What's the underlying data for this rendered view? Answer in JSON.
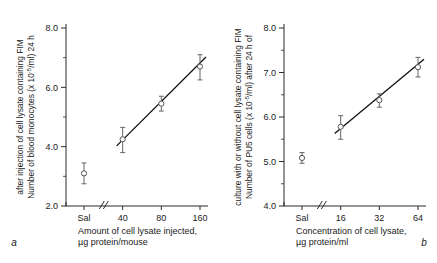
{
  "figure": {
    "background": "#ffffff",
    "line_color": "#111111",
    "marker_color": "#555555",
    "error_color": "#666666"
  },
  "panels": [
    {
      "letter": "a",
      "ylabel_line1": "Number of blood monocytes (x 10",
      "ylabel_exp": "-5",
      "ylabel_line1b": "/ml) 24 h",
      "ylabel_line2": "after injection of cell lysate containing FIM",
      "xlabel_line1": "Amount of cell lysate injected,",
      "xlabel_line2": "µg protein/mouse",
      "chart_data": {
        "type": "scatter",
        "title": "",
        "xlabel": "Amount of cell lysate injected, µg protein/mouse",
        "ylabel": "Number of blood monocytes (x 10-5/ml) 24 h after injection of cell lysate containing FIM",
        "categories": [
          "Sal",
          "40",
          "80",
          "160"
        ],
        "xticklabels": [
          "Sal",
          "40",
          "80",
          "160"
        ],
        "yticklabels": [
          "2.0",
          "4.0",
          "6.0",
          "8.0"
        ],
        "ytickvalues": [
          2.0,
          4.0,
          6.0,
          8.0
        ],
        "yminorticks": [
          3.0,
          5.0,
          7.0
        ],
        "ylim": [
          2.0,
          8.4
        ],
        "axis_break": true,
        "axis_break_after": "Sal",
        "grid": false,
        "legend": "none",
        "points": [
          {
            "x": "Sal",
            "y": 3.1,
            "err_low": 0.35,
            "err_high": 0.35,
            "on_fit": false
          },
          {
            "x": "40",
            "y": 4.25,
            "err_low": 0.45,
            "err_high": 0.4,
            "on_fit": true
          },
          {
            "x": "80",
            "y": 5.45,
            "err_low": 0.25,
            "err_high": 0.25,
            "on_fit": true
          },
          {
            "x": "160",
            "y": 6.7,
            "err_low": 0.45,
            "err_high": 0.4,
            "on_fit": true
          }
        ],
        "fit_line": {
          "x_start": "40",
          "y_start": 4.1,
          "x_end": "160",
          "y_end": 6.95
        }
      }
    },
    {
      "letter": "b",
      "ylabel_line1": "Number of PU5 cells (x 10",
      "ylabel_exp": "-5",
      "ylabel_line1b": "/ml) after 24 h of",
      "ylabel_line2": "culture with or without cell lysate containing FIM",
      "xlabel_line1": "Concentration of cell lysate,",
      "xlabel_line2": "µg protein/ml",
      "chart_data": {
        "type": "scatter",
        "title": "",
        "xlabel": "Concentration of cell lysate, µg protein/ml",
        "ylabel": "Number of PU5 cells (x 10-5/ml) after 24 h of culture with or without cell lysate containing FIM",
        "categories": [
          "Sal",
          "16",
          "32",
          "64"
        ],
        "xticklabels": [
          "Sal",
          "16",
          "32",
          "64"
        ],
        "yticklabels": [
          "4.0",
          "5.0",
          "6.0",
          "7.0",
          "8.0"
        ],
        "ytickvalues": [
          4.0,
          5.0,
          6.0,
          7.0,
          8.0
        ],
        "yminorticks": [
          4.5,
          5.5,
          6.5,
          7.5
        ],
        "ylim": [
          4.0,
          8.4
        ],
        "axis_break": true,
        "axis_break_after": "Sal",
        "grid": false,
        "legend": "none",
        "points": [
          {
            "x": "Sal",
            "y": 5.08,
            "err_low": 0.12,
            "err_high": 0.12,
            "on_fit": false
          },
          {
            "x": "16",
            "y": 5.78,
            "err_low": 0.28,
            "err_high": 0.25,
            "on_fit": true
          },
          {
            "x": "32",
            "y": 6.38,
            "err_low": 0.16,
            "err_high": 0.14,
            "on_fit": true
          },
          {
            "x": "64",
            "y": 7.12,
            "err_low": 0.22,
            "err_high": 0.22,
            "on_fit": true
          }
        ],
        "fit_line": {
          "x_start": "16",
          "y_start": 5.68,
          "x_end": "64",
          "y_end": 7.25
        }
      }
    }
  ]
}
